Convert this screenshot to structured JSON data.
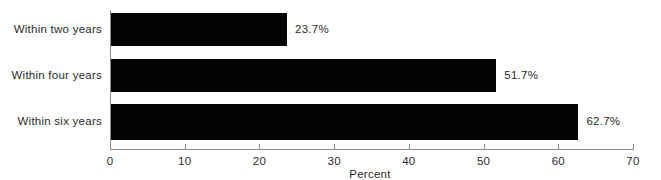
{
  "chart_data": {
    "type": "bar",
    "orientation": "horizontal",
    "title": "",
    "xlabel": "Percent",
    "ylabel": "",
    "categories": [
      "Within two years",
      "Within four years",
      "Within six years"
    ],
    "values": [
      23.7,
      51.7,
      62.7
    ],
    "value_labels": [
      "23.7%",
      "51.7%",
      "62.7%"
    ],
    "xlim": [
      0,
      70
    ],
    "xticks": [
      0,
      10,
      20,
      30,
      40,
      50,
      60,
      70
    ],
    "xtick_labels": [
      "0",
      "10",
      "20",
      "30",
      "40",
      "50",
      "60",
      "70"
    ],
    "grid": false,
    "legend": false,
    "bar_color": "#040404",
    "axis_color": "#8c8c8c",
    "background": "#ffffff"
  }
}
